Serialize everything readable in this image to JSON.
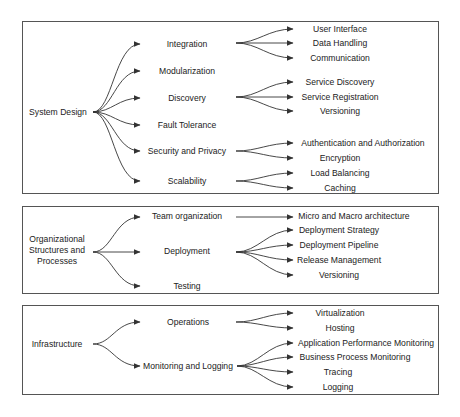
{
  "diagram": {
    "type": "mind-map",
    "sections": [
      {
        "root": "System Design",
        "children": [
          {
            "label": "Integration",
            "children": [
              "User Interface",
              "Data Handling",
              "Communication"
            ]
          },
          {
            "label": "Modularization",
            "children": []
          },
          {
            "label": "Discovery",
            "children": [
              "Service Discovery",
              "Service Registration",
              "Versioning"
            ]
          },
          {
            "label": "Fault Tolerance",
            "children": []
          },
          {
            "label": "Security and Privacy",
            "children": [
              "Authentication and Authorization",
              "Encryption"
            ]
          },
          {
            "label": "Scalability",
            "children": [
              "Load Balancing",
              "Caching"
            ]
          }
        ]
      },
      {
        "root": "Organizational Structures and Processes",
        "root_lines": [
          "Organizational",
          "Structures and",
          "Processes"
        ],
        "children": [
          {
            "label": "Team organization",
            "children": [
              "Micro and Macro architecture"
            ]
          },
          {
            "label": "Deployment",
            "children": [
              "Deployment Strategy",
              "Deployment Pipeline",
              "Release Management",
              "Versioning"
            ]
          },
          {
            "label": "Testing",
            "children": []
          }
        ]
      },
      {
        "root": "Infrastructure",
        "children": [
          {
            "label": "Operations",
            "children": [
              "Virtualization",
              "Hosting"
            ]
          },
          {
            "label": "Monitoring and Logging",
            "children": [
              "Application Performance Monitoring",
              "Business Process Monitoring",
              "Tracing",
              "Logging"
            ]
          }
        ]
      }
    ]
  },
  "colors": {
    "line": "#333333",
    "border": "#555555",
    "text": "#222222",
    "background": "#ffffff"
  }
}
